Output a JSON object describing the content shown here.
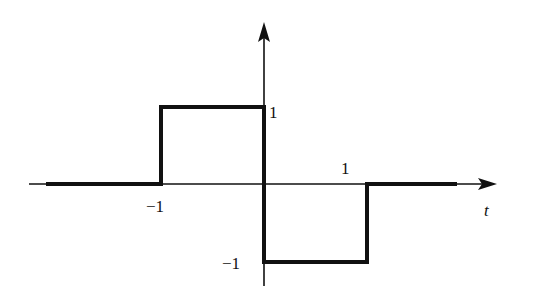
{
  "figure": {
    "type": "piecewise-signal-plot",
    "axes": {
      "x_label": "t",
      "y_label": ""
    },
    "labels": {
      "y_pos_one": "1",
      "y_neg_one": "−1",
      "x_neg_one": "−1",
      "x_pos_one": "1",
      "t_axis": "t"
    },
    "signal": {
      "description": "x(t) = 1 for -1<t<0, -1 for 0<t<1, 0 otherwise",
      "segments": [
        {
          "t_from": -2.0,
          "t_to": -1,
          "value": 0
        },
        {
          "t_from": -1,
          "t_to": 0,
          "value": 1
        },
        {
          "t_from": 0,
          "t_to": 1,
          "value": -1
        },
        {
          "t_from": 1,
          "t_to": 2.0,
          "value": 0
        }
      ]
    },
    "colors": {
      "stroke": "#111111",
      "background": "#ffffff"
    }
  }
}
